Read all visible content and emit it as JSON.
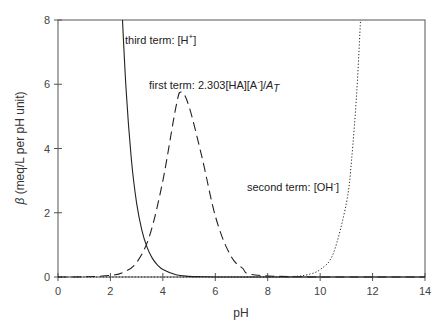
{
  "chart_data": {
    "type": "line",
    "title": "",
    "xlabel": "pH",
    "ylabel": "β (meq/L per pH unit)",
    "xlim": [
      0,
      14
    ],
    "ylim": [
      0,
      8
    ],
    "xticks": [
      0,
      2,
      4,
      6,
      8,
      10,
      12,
      14
    ],
    "yticks": [
      0,
      2,
      4,
      6,
      8
    ],
    "grid": false,
    "legend": "none (inline annotations)",
    "series": [
      {
        "name": "third term: [H+]",
        "style": "solid",
        "x": [
          2.46,
          2.6,
          2.8,
          3.0,
          3.2,
          3.4,
          3.6,
          3.8,
          4.0,
          4.5,
          5.0,
          5.5,
          6.0,
          7.0,
          8.0,
          14.0
        ],
        "values": [
          8.0,
          5.79,
          3.65,
          2.3,
          1.45,
          0.92,
          0.58,
          0.37,
          0.23,
          0.07,
          0.02,
          0.01,
          0.0,
          0.0,
          0.0,
          0.0
        ]
      },
      {
        "name": "first term: 2.303[HA][A-]/A_T",
        "style": "dashed",
        "x": [
          0,
          1,
          2,
          2.5,
          3,
          3.5,
          4,
          4.5,
          4.7,
          5,
          5.5,
          6,
          6.5,
          7,
          8,
          14
        ],
        "values": [
          0.0,
          0.005,
          0.05,
          0.15,
          0.45,
          1.3,
          3.0,
          5.3,
          5.76,
          5.3,
          3.7,
          1.9,
          0.8,
          0.3,
          0.03,
          0.0
        ]
      },
      {
        "name": "second term: [OH-]",
        "style": "dotted",
        "x": [
          0,
          8,
          9,
          9.5,
          10,
          10.5,
          11,
          11.2,
          11.4,
          11.54
        ],
        "values": [
          0.0,
          0.0,
          0.02,
          0.07,
          0.23,
          0.73,
          2.3,
          3.65,
          5.79,
          8.0
        ]
      }
    ],
    "annotations": [
      {
        "text": "third term: [H",
        "sup": "+",
        "tail": "]",
        "x": 2.6,
        "y": 7.6
      },
      {
        "text": "first term: 2.303[HA][A",
        "sup": "-",
        "tail": "]/A",
        "sub": "T",
        "x": 3.4,
        "y": 6.0
      },
      {
        "text": "second term: [OH",
        "sup": "-",
        "tail": "]",
        "x": 7.2,
        "y": 2.25
      }
    ]
  },
  "labels": {
    "xlabel": "pH",
    "ylabel_symbol": "β",
    "ylabel_rest": " (meq/L per pH unit)",
    "ann_third": "third term: [H",
    "ann_third_sup": "+",
    "ann_third_tail": "]",
    "ann_first": "first term: 2.303[HA][A",
    "ann_first_sup": "-",
    "ann_first_tail": "]/",
    "ann_first_A": "A",
    "ann_first_sub": "T",
    "ann_second": "second term: [OH",
    "ann_second_sup": "-",
    "ann_second_tail": "]"
  }
}
